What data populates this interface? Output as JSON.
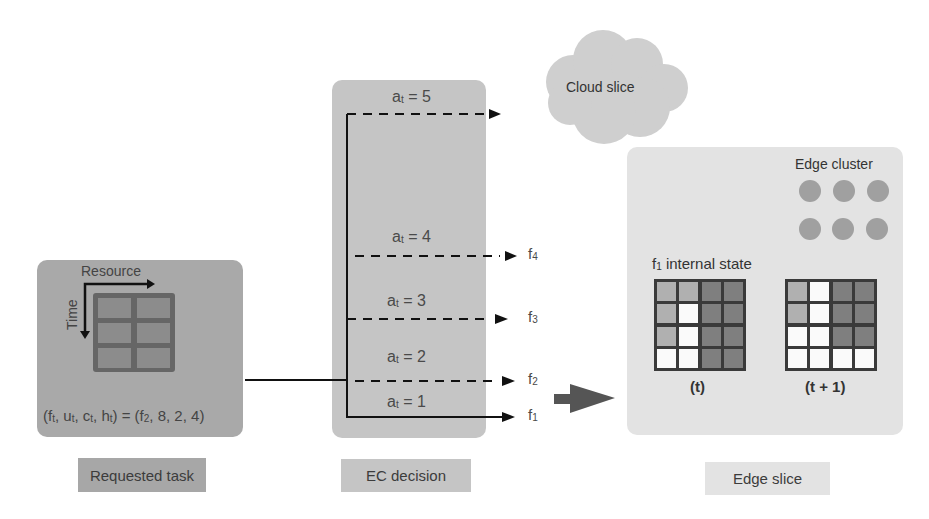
{
  "requested_task": {
    "caption": "Requested task",
    "axis_resource_label": "Resource",
    "axis_time_label": "Time",
    "tuple_label": "(f",
    "tuple": {
      "lhs": [
        "f",
        "t",
        "u",
        "t",
        "c",
        "t",
        "h",
        "t"
      ],
      "text_prefix": "(f",
      "f_sub": "t",
      "u": "u",
      "u_sub": "t",
      "c": "c",
      "c_sub": "t",
      "h": "h",
      "h_sub": "t",
      "rhs_f": "f",
      "rhs_f_sub": "2",
      "rhs_values": "8, 2, 4"
    },
    "grid": {
      "rows": 3,
      "cols": 2
    }
  },
  "ec_decision": {
    "caption": "EC decision",
    "actions": [
      {
        "var": "a",
        "sub": "t",
        "value": "5",
        "target": "cloud",
        "style": "dashed"
      },
      {
        "var": "a",
        "sub": "t",
        "value": "4",
        "target": "f4",
        "target_label": "f",
        "target_sub": "4",
        "style": "dashed"
      },
      {
        "var": "a",
        "sub": "t",
        "value": "3",
        "target": "f3",
        "target_label": "f",
        "target_sub": "3",
        "style": "dashed"
      },
      {
        "var": "a",
        "sub": "t",
        "value": "2",
        "target": "f2",
        "target_label": "f",
        "target_sub": "2",
        "style": "dashed"
      },
      {
        "var": "a",
        "sub": "t",
        "value": "1",
        "target": "f1",
        "target_label": "f",
        "target_sub": "1",
        "style": "solid"
      }
    ]
  },
  "cloud_slice": {
    "label": "Cloud slice"
  },
  "edge_slice": {
    "caption": "Edge slice",
    "cluster_label": "Edge cluster",
    "cluster_nodes": 6,
    "internal_state_label": "f",
    "internal_state_sub": "1",
    "internal_state_suffix": " internal state",
    "grids": [
      {
        "label": "(t)",
        "cells": [
          [
            "mid",
            "mid",
            "dark",
            "dark"
          ],
          [
            "mid",
            "white",
            "dark",
            "dark"
          ],
          [
            "mid",
            "white",
            "dark",
            "dark"
          ],
          [
            "white",
            "white",
            "dark",
            "dark"
          ]
        ]
      },
      {
        "label": "(t + 1)",
        "cells": [
          [
            "mid",
            "white",
            "dark",
            "dark"
          ],
          [
            "mid",
            "white",
            "dark",
            "dark"
          ],
          [
            "white",
            "white",
            "dark",
            "dark"
          ],
          [
            "white",
            "white",
            "white",
            "white"
          ]
        ]
      }
    ]
  },
  "colors": {
    "task_box": "#a9a9a9",
    "ec_box": "#c5c5c5",
    "edge_box": "#e3e3e3",
    "cloud": "#cfcfcf",
    "node": "#a0a0a0",
    "cell_dark": "#7f7f7f",
    "cell_mid": "#b0b0b0",
    "cell_white": "#fafafa",
    "grid_border": "#3a3a3a",
    "arrow": "#1a1a1a"
  }
}
